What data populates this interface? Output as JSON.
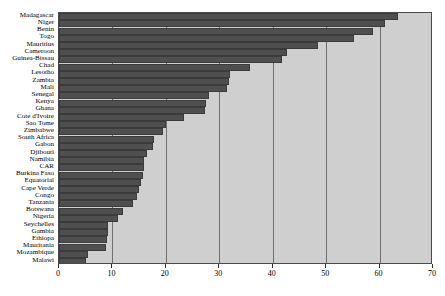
{
  "chart_data": {
    "type": "bar",
    "orientation": "horizontal",
    "title": "",
    "subtitle": "",
    "xlabel": "",
    "ylabel": "",
    "xlim": [
      0,
      70
    ],
    "ylim": null,
    "grid": true,
    "gridlines_x": [
      0,
      10,
      20,
      30,
      40,
      50,
      60,
      70
    ],
    "legend": null,
    "legend_position": "none",
    "xticks": [
      0,
      10,
      20,
      30,
      40,
      50,
      60,
      70
    ],
    "xticklabels": [
      "0",
      "10",
      "20",
      "30",
      "40",
      "50",
      "60",
      "70"
    ],
    "categories": [
      "Madagascar",
      "Niger",
      "Benin",
      "Togo",
      "Mauritius",
      "Cameroon",
      "Guinea-Bissau",
      "Chad",
      "Lesotho",
      "Zambia",
      "Mali",
      "Senegal",
      "Kenya",
      "Ghana",
      "Cote d'Ivoire",
      "Sao Tome",
      "Zimbabwe",
      "South Africa",
      "Gabon",
      "Djibouti",
      "Namibia",
      "CAR",
      "Burkina Faso",
      "Equatorial",
      "Cape Verde",
      "Congo",
      "Tanzania",
      "Botswana",
      "Nigeria",
      "Seychelles",
      "Gambia",
      "Ethiopa",
      "Mauritania",
      "Mozambique",
      "Malawi"
    ],
    "values": [
      63.5,
      61.0,
      58.8,
      55.3,
      48.5,
      42.6,
      41.7,
      35.7,
      32.0,
      31.8,
      31.5,
      28.0,
      27.6,
      27.4,
      23.4,
      20.0,
      19.5,
      17.8,
      17.6,
      16.4,
      16.0,
      15.9,
      15.8,
      15.3,
      15.0,
      14.6,
      13.9,
      12.0,
      11.0,
      9.2,
      9.1,
      9.0,
      8.8,
      5.4,
      5.0
    ],
    "colors": {
      "bar_fill": "#4f4f4f",
      "bar_edge": "#3b3b3b",
      "plot_background": "#cfcfcf",
      "frame": "#4a4a4a",
      "gridline": "#6f6f6f",
      "text": "#000000",
      "figure_background": "#ffffff"
    }
  }
}
